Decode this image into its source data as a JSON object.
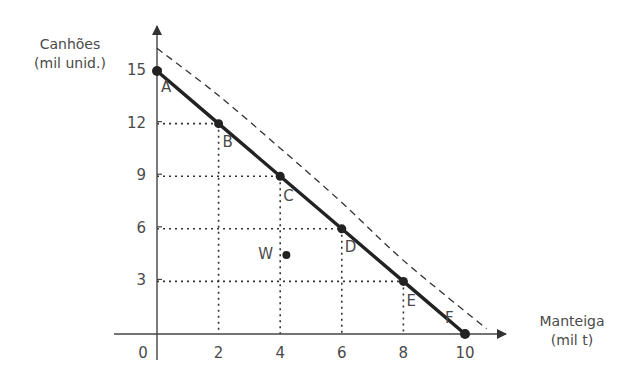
{
  "chart_data": {
    "type": "line",
    "title": "",
    "xlabel": "Manteiga (mil t)",
    "ylabel": "Canhões (mil unid.)",
    "xlabel_lines": [
      "Manteiga",
      "(mil t)"
    ],
    "ylabel_lines": [
      "Canhões",
      "(mil unid.)"
    ],
    "x_ticks": [
      0,
      2,
      4,
      6,
      8,
      10
    ],
    "y_ticks": [
      3,
      6,
      9,
      12,
      15
    ],
    "xlim": [
      0,
      10.8
    ],
    "ylim": [
      0,
      16.8
    ],
    "grid": "dotted guide lines from each frontier point to axes",
    "legend": "none",
    "series": [
      {
        "name": "Fronteira de possibilidades de produção",
        "style": "solid thick",
        "points": [
          {
            "label": "A",
            "x": 0,
            "y": 15
          },
          {
            "label": "B",
            "x": 2,
            "y": 12
          },
          {
            "label": "C",
            "x": 4,
            "y": 9
          },
          {
            "label": "D",
            "x": 6,
            "y": 6
          },
          {
            "label": "E",
            "x": 8,
            "y": 3
          },
          {
            "label": "F",
            "x": 10,
            "y": 0
          }
        ]
      },
      {
        "name": "Fronteira deslocada (expansão)",
        "style": "dashed",
        "points": [
          {
            "x": 0,
            "y": 16.3
          },
          {
            "x": 2,
            "y": 13.6
          },
          {
            "x": 4,
            "y": 10.6
          },
          {
            "x": 6,
            "y": 7.5
          },
          {
            "x": 8,
            "y": 4.2
          },
          {
            "x": 10.7,
            "y": 0.3
          }
        ]
      }
    ],
    "annotations": [
      {
        "label": "W",
        "x": 4.2,
        "y": 4.5,
        "type": "point"
      }
    ]
  }
}
